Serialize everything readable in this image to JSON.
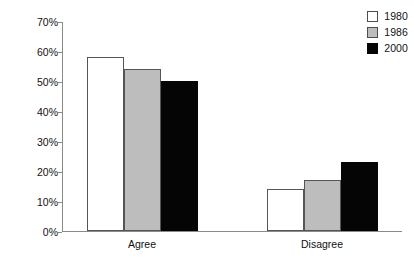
{
  "chart_data": {
    "type": "bar",
    "title": "",
    "xlabel": "",
    "ylabel": "",
    "categories": [
      "Agree",
      "Disagree"
    ],
    "series": [
      {
        "name": "1980",
        "color": "#ffffff",
        "values": [
          58,
          14
        ]
      },
      {
        "name": "1986",
        "color": "#bdbdbd",
        "values": [
          54,
          17
        ]
      },
      {
        "name": "2000",
        "color": "#000000",
        "values": [
          50,
          23
        ]
      }
    ],
    "ylim": [
      0,
      70
    ],
    "y_tick_values": [
      0,
      10,
      20,
      30,
      40,
      50,
      60,
      70
    ],
    "y_tick_labels": [
      "0%",
      "10%",
      "20%",
      "30%",
      "40%",
      "50%",
      "60%",
      "70%"
    ],
    "grid": false,
    "legend_position": "top-right",
    "value_suffix": "%"
  },
  "legend": {
    "entries": [
      {
        "label": "1980",
        "swatch": "white-swatch"
      },
      {
        "label": "1986",
        "swatch": "gray-swatch"
      },
      {
        "label": "2000",
        "swatch": "black-swatch"
      }
    ]
  },
  "axes": {
    "y_labels": [
      "70%",
      "60%",
      "50%",
      "40%",
      "30%",
      "20%",
      "10%",
      "0%"
    ],
    "x_labels": [
      "Agree",
      "Disagree"
    ]
  }
}
